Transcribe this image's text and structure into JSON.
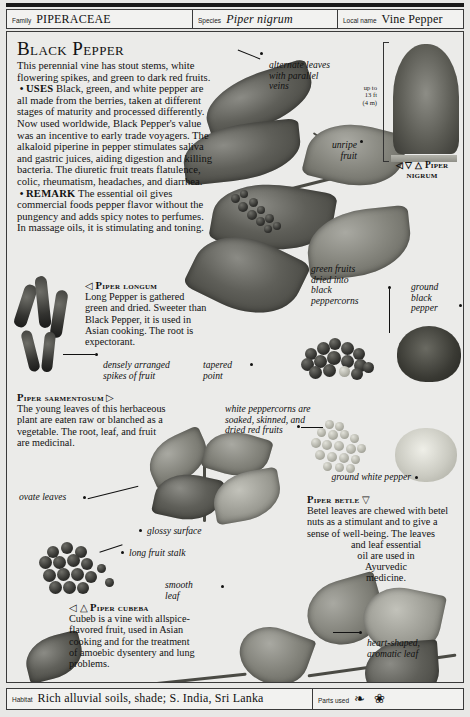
{
  "header": {
    "family_label": "Family",
    "family_value": "PIPERACEAE",
    "species_label": "Species",
    "species_value": "Piper nigrum",
    "local_label": "Local name",
    "local_value": "Vine Pepper"
  },
  "title": "Black Pepper",
  "intro": {
    "lead": "This perennial vine has stout stems, white flowering spikes, and green to dark red fruits.",
    "uses_label": "USES",
    "uses_text": "Black, green, and white pepper are all made from the berries, taken at different stages of maturity and processed differently. Now used worldwide, Black Pepper's value was an incentive to early trade voyagers. The alkaloid piperine in pepper stimulates saliva and gastric juices, aiding digestion and killing bacteria. The diuretic fruit treats flatulence, colic, rheumatism, headaches, and diarrhea.",
    "remark_label": "REMARK",
    "remark_text": "The essential oil gives commercial foods pepper flavor without the pungency and adds spicy notes to perfumes. In massage oils, it is stimulating and toning."
  },
  "captions": {
    "longum": {
      "marker": "◁",
      "heading": "Piper longum",
      "body": "Long Pepper is gathered green and dried. Sweeter than Black Pepper, it is used in Asian cooking. The root is expectorant."
    },
    "sarmentosum": {
      "marker": "▷",
      "heading": "Piper sarmentosum",
      "body": "The young leaves of this herbaceous plant are eaten raw or blanched as a vegetable. The root, leaf, and fruit are medicinal."
    },
    "betle": {
      "marker": "▽",
      "heading": "Piper betle",
      "body_line1": "Betel leaves are chewed with betel",
      "body_line2": "nuts as a stimulant and to give a",
      "body_line3": "sense of well-being. The leaves",
      "body_line4": "and leaf essential",
      "body_line5": "oil are used in",
      "body_line6": "Ayurvedic",
      "body_line7": "medicine."
    },
    "cubeba": {
      "marker": "◁ △",
      "heading": "Piper cubeba",
      "body": "Cubeb is a vine with allspice-flavored fruit, used in Asian cooking and for the treatment of amoebic dysentery and lung problems."
    }
  },
  "vine": {
    "scale_line1": "up to",
    "scale_line2": "13 ft",
    "scale_line3": "(4 m)",
    "caption_marker": "◁ ▽ △",
    "caption_line1": "Piper",
    "caption_line2": "nigrum"
  },
  "annotations": {
    "alternate_leaves": "alternate leaves\nwith parallel\nveins",
    "unripe_fruit": "unripe\nfruit",
    "green_fruits": "green fruits\ndried into\nblack\npeppercorns",
    "ground_black_pepper": "ground\nblack\npepper",
    "densely_arranged": "densely arranged\nspikes of fruit",
    "tapered_point": "tapered\npoint",
    "white_peppercorns": "white peppercorns are\nsoaked, skinned, and\ndried red fruits",
    "ground_white_pepper": "ground white pepper",
    "ovate_leaves": "ovate leaves",
    "glossy_surface": "glossy surface",
    "long_fruit_stalk": "long fruit stalk",
    "smooth_leaf": "smooth\nleaf",
    "heart_shaped": "heart-shaped,\naromatic leaf"
  },
  "footer": {
    "habitat_label": "Habitat",
    "habitat_value": "Rich alluvial soils, shade; S. India, Sri Lanka",
    "parts_label": "Parts used",
    "parts_icons": "❧ ❀"
  }
}
